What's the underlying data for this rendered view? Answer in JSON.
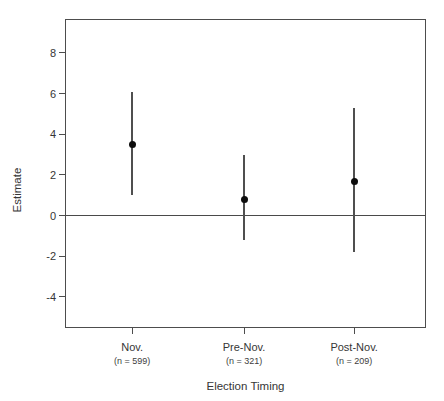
{
  "chart_data": {
    "type": "scatter",
    "title": "",
    "xlabel": "Election Timing",
    "ylabel": "Estimate",
    "ylim": [
      -5.53,
      9.67
    ],
    "yticks": [
      8,
      6,
      4,
      2,
      0,
      -2,
      -4
    ],
    "ytick_labels": [
      "8",
      "6",
      "4",
      "2",
      "0",
      "-2",
      "-4"
    ],
    "reference_line_y": 0,
    "grid": false,
    "legend": "none",
    "categories": [
      "Nov.",
      "Pre-Nov.",
      "Post-Nov."
    ],
    "category_sublabels": [
      "(n = 599)",
      "(n = 321)",
      "(n = 209)"
    ],
    "category_x_fractions": [
      0.186,
      0.496,
      0.801
    ],
    "series": [
      {
        "name": "point-estimate-with-95ci",
        "values": [
          3.5,
          0.8,
          1.7
        ],
        "ci_lower": [
          1.0,
          -1.2,
          -1.8
        ],
        "ci_upper": [
          6.1,
          3.0,
          5.3
        ]
      }
    ],
    "colors": {
      "point": "#0d0d0d",
      "error_bar": "#4f4f4f",
      "box_border": "#4d4d4d",
      "zero_line": "#4a4a4a",
      "text": "#363636",
      "background": "#ffffff"
    }
  },
  "layout": {
    "plot_box": {
      "left": 65,
      "top": 19,
      "width": 361,
      "height": 309
    }
  }
}
